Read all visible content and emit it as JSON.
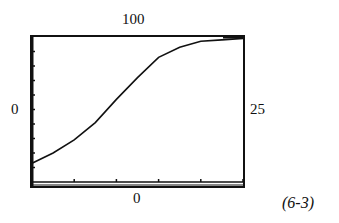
{
  "figure_label": "(6-3)",
  "window": {
    "xmin_label": "0",
    "xmax_label": "25",
    "ymin_label": "0",
    "ymax_label": "100"
  },
  "chart_data": {
    "type": "line",
    "title": "",
    "xlabel": "",
    "ylabel": "",
    "xlim": [
      0,
      25
    ],
    "ylim": [
      0,
      100
    ],
    "x_ticks_every": 5,
    "y_ticks_every": 10,
    "grid": false,
    "legend": null,
    "annotations": [
      "(6-3)"
    ],
    "series": [
      {
        "name": "curve",
        "x": [
          0,
          2.5,
          5,
          7.5,
          10,
          12.5,
          15,
          17.5,
          20,
          22.5,
          25
        ],
        "y": [
          13,
          20,
          29,
          41,
          57,
          72,
          86,
          93,
          97,
          98,
          99
        ]
      }
    ]
  }
}
